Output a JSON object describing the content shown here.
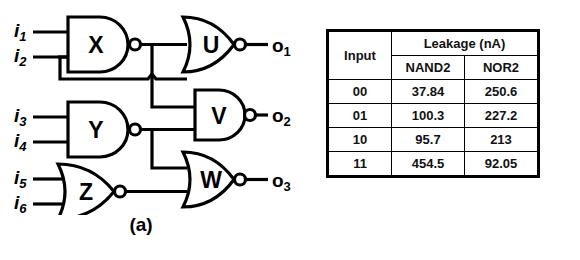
{
  "figure": {
    "caption_a": "(a)",
    "caption_b": "(b)"
  },
  "circuit": {
    "inputs": [
      {
        "label": "i",
        "sub": "1"
      },
      {
        "label": "i",
        "sub": "2"
      },
      {
        "label": "i",
        "sub": "3"
      },
      {
        "label": "i",
        "sub": "4"
      },
      {
        "label": "i",
        "sub": "5"
      },
      {
        "label": "i",
        "sub": "6"
      }
    ],
    "gates": [
      {
        "name": "X",
        "type": "NAND2"
      },
      {
        "name": "Y",
        "type": "NAND2"
      },
      {
        "name": "Z",
        "type": "NOR2"
      },
      {
        "name": "U",
        "type": "NOR2"
      },
      {
        "name": "V",
        "type": "NAND2"
      },
      {
        "name": "W",
        "type": "NOR2"
      }
    ],
    "outputs": [
      {
        "label": "o",
        "sub": "1"
      },
      {
        "label": "o",
        "sub": "2"
      },
      {
        "label": "o",
        "sub": "3"
      }
    ],
    "line_color": "#000000"
  },
  "table": {
    "header_input": "Input",
    "header_leakage": "Leakage (nA)",
    "sub_headers": [
      "NAND2",
      "NOR2"
    ],
    "rows": [
      {
        "input": "00",
        "nand2": "37.84",
        "nor2": "250.6"
      },
      {
        "input": "01",
        "nand2": "100.3",
        "nor2": "227.2"
      },
      {
        "input": "10",
        "nand2": "95.7",
        "nor2": "213"
      },
      {
        "input": "11",
        "nand2": "454.5",
        "nor2": "92.05"
      }
    ]
  }
}
